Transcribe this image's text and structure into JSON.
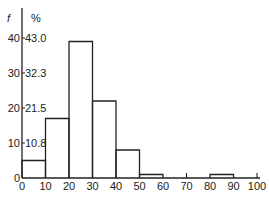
{
  "chart_data": {
    "type": "bar",
    "title": "",
    "xlabel": "",
    "ylabel": "f",
    "ylabel_secondary": "%",
    "bins": [
      [
        0,
        10
      ],
      [
        10,
        20
      ],
      [
        20,
        30
      ],
      [
        30,
        40
      ],
      [
        40,
        50
      ],
      [
        50,
        60
      ],
      [
        60,
        70
      ],
      [
        70,
        80
      ],
      [
        80,
        90
      ],
      [
        90,
        100
      ]
    ],
    "categories": [
      "0-10",
      "10-20",
      "20-30",
      "30-40",
      "40-50",
      "50-60",
      "60-70",
      "70-80",
      "80-90",
      "90-100"
    ],
    "values": [
      5,
      17,
      39,
      22,
      8,
      1,
      0,
      0,
      1,
      0
    ],
    "x_ticks": [
      "0",
      "10",
      "20",
      "30",
      "40",
      "50",
      "60",
      "70",
      "80",
      "90",
      "100"
    ],
    "y_ticks": [
      "0",
      "10",
      "20",
      "30",
      "40"
    ],
    "y_ticks_percent": [
      "10.8",
      "21.5",
      "32.3",
      "43.0"
    ],
    "xlim": [
      0,
      100
    ],
    "ylim": [
      0,
      40
    ],
    "grid": false,
    "legend": null
  }
}
